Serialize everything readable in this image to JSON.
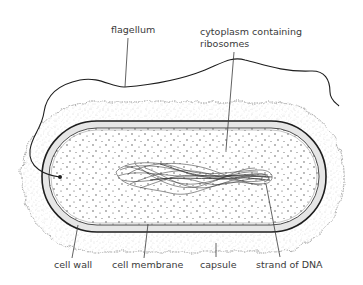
{
  "labels": {
    "flagellum": "flagellum",
    "cytoplasm_line1": "cytoplasm containing",
    "cytoplasm_line2": "ribosomes",
    "cell_wall": "cell wall",
    "cell_membrane": "cell membrane",
    "capsule": "capsule",
    "strand_of_dna": "strand of DNA"
  },
  "colors": {
    "line": "#2a2a2a",
    "capsule_stipple": "#9a9a9a",
    "wall_fill": "#e6e6e6",
    "background": "#ffffff"
  }
}
